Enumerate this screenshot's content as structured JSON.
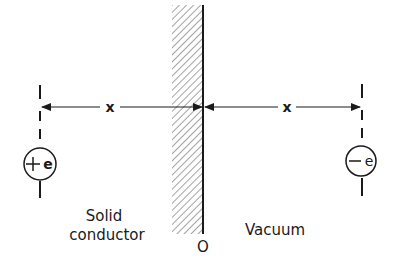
{
  "diagram": {
    "regions": {
      "left_label_line1": "Solid",
      "left_label_line2": "conductor",
      "right_label": "Vacuum"
    },
    "origin_label": "O",
    "distances": {
      "left": "x",
      "right": "x"
    },
    "charges": {
      "image_charge": {
        "sign": "+",
        "symbol": "e"
      },
      "electron": {
        "sign": "−",
        "symbol": "e"
      }
    },
    "colors": {
      "ink": "#1a1a1a",
      "hatch": "#555555",
      "background": "#ffffff"
    }
  }
}
